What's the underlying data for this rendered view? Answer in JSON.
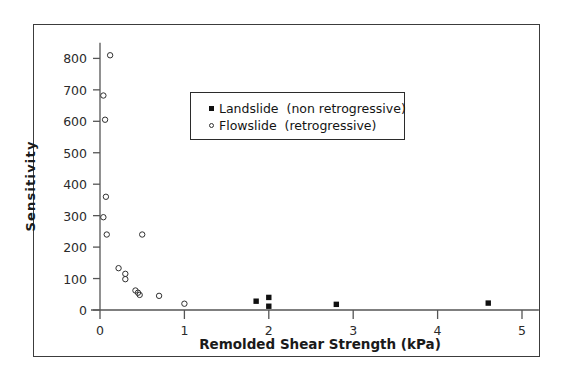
{
  "chart_data": {
    "type": "scatter",
    "title": "",
    "xlabel": "Remolded  Shear  Strength  (kPa)",
    "ylabel": "Sensitivity",
    "xlim": [
      0,
      5.2
    ],
    "ylim": [
      0,
      850
    ],
    "xticks": [
      0,
      1,
      2,
      3,
      4,
      5
    ],
    "xtick_labels": [
      "0",
      "1",
      "2",
      "3",
      "4",
      "5"
    ],
    "yticks": [
      0,
      100,
      200,
      300,
      400,
      500,
      600,
      700,
      800
    ],
    "ytick_labels": [
      "0",
      "100",
      "200",
      "300",
      "400",
      "500",
      "600",
      "700",
      "800"
    ],
    "grid": false,
    "legend_position": "upper-center",
    "series": [
      {
        "name": "Landslide  (non retrogressive)",
        "marker": "filled-square",
        "color": "#101010",
        "points": [
          {
            "x": 1.85,
            "y": 28
          },
          {
            "x": 2.0,
            "y": 40
          },
          {
            "x": 2.0,
            "y": 12
          },
          {
            "x": 2.8,
            "y": 18
          },
          {
            "x": 4.6,
            "y": 22
          }
        ]
      },
      {
        "name": "Flowslide  (retrogressive)",
        "marker": "open-circle",
        "color": "#303030",
        "points": [
          {
            "x": 0.12,
            "y": 810
          },
          {
            "x": 0.04,
            "y": 682
          },
          {
            "x": 0.06,
            "y": 605
          },
          {
            "x": 0.07,
            "y": 360
          },
          {
            "x": 0.04,
            "y": 295
          },
          {
            "x": 0.08,
            "y": 240
          },
          {
            "x": 0.5,
            "y": 240
          },
          {
            "x": 0.22,
            "y": 133
          },
          {
            "x": 0.3,
            "y": 115
          },
          {
            "x": 0.3,
            "y": 98
          },
          {
            "x": 0.42,
            "y": 62
          },
          {
            "x": 0.45,
            "y": 55
          },
          {
            "x": 0.47,
            "y": 48
          },
          {
            "x": 0.7,
            "y": 45
          },
          {
            "x": 1.0,
            "y": 20
          }
        ]
      }
    ]
  },
  "legend": {
    "items": [
      {
        "marker": "filled-square",
        "label": "Landslide  (non retrogressive)"
      },
      {
        "marker": "open-circle",
        "label": "Flowslide  (retrogressive)"
      }
    ]
  },
  "colors": {
    "axis": "#555555",
    "frame": "#3c3c3c",
    "text": "#1a1a1a",
    "marker_fill": "#101010",
    "marker_stroke": "#303030",
    "background": "#ffffff"
  }
}
